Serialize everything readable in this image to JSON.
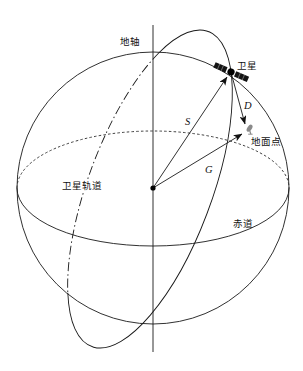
{
  "diagram": {
    "labels": {
      "earth_axis": "地轴",
      "satellite": "卫星",
      "ground_point": "地面点",
      "satellite_orbit": "卫星轨道",
      "equator": "赤道"
    },
    "vector_labels": {
      "s": "S",
      "d": "D",
      "g": "G"
    },
    "icons": {
      "satellite": "satellite-icon",
      "ground_point": "ground-station-icon",
      "earth_center": "center-dot"
    }
  },
  "colors": {
    "line": "#1a1a1a",
    "background": "#ffffff",
    "ground_icon": "#8a8a8a"
  }
}
